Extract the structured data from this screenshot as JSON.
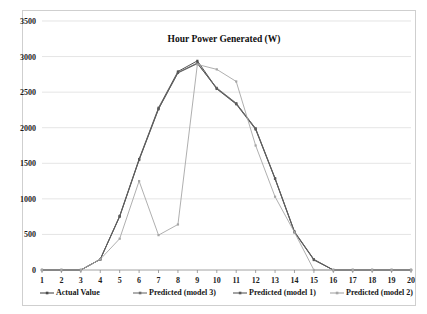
{
  "chart_data": {
    "type": "line",
    "title": "Hour  Power Generated (W)",
    "xlabel": "",
    "ylabel": "",
    "grid": true,
    "legend_position": "bottom",
    "xlim": [
      1,
      20
    ],
    "ylim": [
      0,
      3500
    ],
    "ytick_step": 500,
    "yticks": [
      "0",
      "500",
      "1000",
      "1500",
      "2000",
      "2500",
      "3000",
      "3500"
    ],
    "x": [
      1,
      2,
      3,
      4,
      5,
      6,
      7,
      8,
      9,
      10,
      11,
      12,
      13,
      14,
      15,
      16,
      17,
      18,
      19,
      20
    ],
    "xticks": [
      "1",
      "2",
      "3",
      "4",
      "5",
      "6",
      "7",
      "8",
      "9",
      "10",
      "11",
      "12",
      "13",
      "14",
      "15",
      "16",
      "17",
      "18",
      "19",
      "20"
    ],
    "series": [
      {
        "name": "Actual Value",
        "color": "#4a4a4a",
        "values": [
          0,
          0,
          0,
          150,
          760,
          1560,
          2280,
          2790,
          2940,
          2550,
          2340,
          1990,
          1290,
          540,
          150,
          0,
          0,
          0,
          0,
          0
        ]
      },
      {
        "name": "Predicted (model 3)",
        "color": "#6e6e6e",
        "values": [
          0,
          0,
          0,
          150,
          755,
          1550,
          2265,
          2770,
          2900,
          2560,
          2345,
          1985,
          1285,
          535,
          145,
          0,
          0,
          0,
          0,
          0
        ]
      },
      {
        "name": "Predicted (model 1)",
        "color": "#5a5a5a",
        "values": [
          0,
          0,
          0,
          150,
          750,
          1545,
          2260,
          2775,
          2910,
          2545,
          2330,
          1975,
          1280,
          530,
          140,
          0,
          0,
          0,
          0,
          0
        ]
      },
      {
        "name": "Predicted (model 2)",
        "color": "#a6a6a6",
        "values": [
          0,
          0,
          0,
          150,
          440,
          1250,
          490,
          640,
          2890,
          2820,
          2650,
          1750,
          1030,
          530,
          0,
          0,
          0,
          0,
          0,
          0
        ]
      }
    ]
  },
  "legend": {
    "items": [
      {
        "label": "Actual Value",
        "color": "#4a4a4a"
      },
      {
        "label": "Predicted (model 3)",
        "color": "#6e6e6e"
      },
      {
        "label": "Predicted (model 1)",
        "color": "#5a5a5a"
      },
      {
        "label": "Predicted (model 2)",
        "color": "#a6a6a6"
      }
    ]
  }
}
